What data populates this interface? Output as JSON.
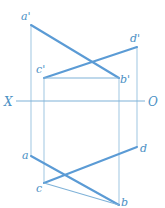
{
  "figure": {
    "background_color": "#ffffff",
    "line_color": "#5b9bd5",
    "projector_color": "#a8cbe4",
    "axis_color": "#7fb2d8",
    "label_color": "#4a90c4",
    "canvas": {
      "width": 165,
      "height": 208
    }
  },
  "axis": {
    "name": "ground-line",
    "left_label": "X",
    "right_label": "O",
    "y": 101,
    "x_start": 16,
    "x_end": 145,
    "left_label_x": 4,
    "left_label_y": 106,
    "right_label_x": 148,
    "right_label_y": 106
  },
  "points": {
    "a_prime": {
      "label": "a'",
      "x": 31,
      "y": 25,
      "label_x": 21,
      "label_y": 20
    },
    "d_prime": {
      "label": "d'",
      "x": 137,
      "y": 47,
      "label_x": 130,
      "label_y": 42
    },
    "c_prime": {
      "label": "c'",
      "x": 44,
      "y": 78,
      "label_x": 36,
      "label_y": 73
    },
    "b_prime": {
      "label": "b'",
      "x": 119,
      "y": 78,
      "label_x": 120,
      "label_y": 83
    },
    "a": {
      "label": "a",
      "x": 31,
      "y": 156,
      "label_x": 22,
      "label_y": 159
    },
    "d": {
      "label": "d",
      "x": 137,
      "y": 147,
      "label_x": 140,
      "label_y": 152
    },
    "c": {
      "label": "c",
      "x": 44,
      "y": 183,
      "label_x": 36,
      "label_y": 192
    },
    "b": {
      "label": "b",
      "x": 119,
      "y": 205,
      "label_x": 121,
      "label_y": 206
    }
  },
  "segments": {
    "ab_front": {
      "name": "a'b'",
      "x1": 31,
      "y1": 25,
      "x2": 119,
      "y2": 78
    },
    "cd_front": {
      "name": "c'd'",
      "x1": 44,
      "y1": 78,
      "x2": 137,
      "y2": 47
    },
    "ab_top": {
      "name": "ab",
      "x1": 31,
      "y1": 156,
      "x2": 119,
      "y2": 205
    },
    "cd_top": {
      "name": "cd",
      "x1": 44,
      "y1": 183,
      "x2": 137,
      "y2": 147
    }
  },
  "projectors": {
    "a": {
      "name": "projector-a",
      "x": 31,
      "y1": 25,
      "y2": 156
    },
    "c": {
      "name": "projector-c",
      "x": 44,
      "y1": 78,
      "y2": 183
    },
    "b": {
      "name": "projector-b",
      "x": 119,
      "y1": 78,
      "y2": 205
    },
    "d": {
      "name": "projector-d",
      "x": 137,
      "y1": 47,
      "y2": 147
    }
  }
}
